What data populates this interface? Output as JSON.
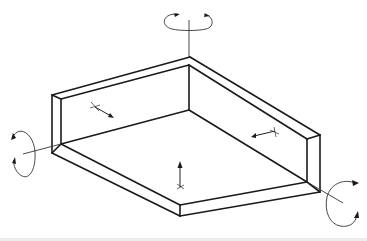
{
  "diagram": {
    "title": "",
    "colors": {
      "background": "#ffffff",
      "line": "#1a1a1a"
    },
    "components": [
      {
        "id": "floor-plate",
        "label": ""
      },
      {
        "id": "left-back-wall",
        "label": ""
      },
      {
        "id": "right-back-wall",
        "label": ""
      }
    ],
    "rotation_axes": [
      {
        "id": "vertical-axis",
        "orientation": "vertical",
        "icon": "rotate-arrow-icon"
      },
      {
        "id": "left-horizontal-axis",
        "orientation": "horizontal-left",
        "icon": "rotate-arrow-icon"
      },
      {
        "id": "right-horizontal-axis",
        "orientation": "horizontal-right",
        "icon": "rotate-arrow-icon"
      }
    ],
    "translation_vectors": [
      {
        "id": "left-wall-vector",
        "direction": "down-right",
        "icon": "arrow-icon"
      },
      {
        "id": "right-wall-vector",
        "direction": "left",
        "icon": "arrow-icon"
      },
      {
        "id": "floor-vector",
        "direction": "up",
        "icon": "arrow-icon"
      }
    ]
  }
}
